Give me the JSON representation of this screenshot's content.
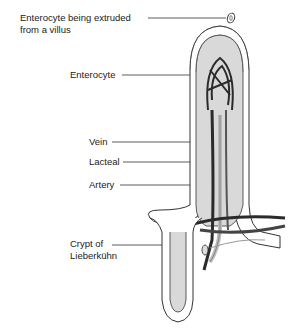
{
  "figure": {
    "labels": {
      "extruded_line1": "Enterocyte being extruded",
      "extruded_line2": "from a villus",
      "enterocyte": "Enterocyte",
      "vein": "Vein",
      "lacteal": "Lacteal",
      "artery": "Artery",
      "crypt_line1": "Crypt of",
      "crypt_line2": "Lieberkühn"
    },
    "colors": {
      "stroma": "#d9d9d9",
      "outline": "#333333",
      "vessel_dark": "#2b2b2b",
      "lacteal": "#cfcfcf"
    }
  }
}
